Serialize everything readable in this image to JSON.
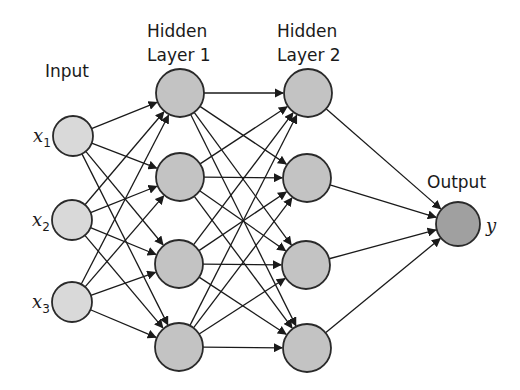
{
  "diagram": {
    "colors": {
      "input_fill": "#d9d9d9",
      "hidden_fill": "#c3c3c3",
      "output_fill": "#a0a0a0",
      "stroke": "#2a2a2a",
      "edge": "#1a1a1a"
    },
    "layers": [
      {
        "id": "input",
        "label_lines": [
          "Input"
        ],
        "label_pos": [
          45,
          77
        ],
        "radius": 20,
        "fill_key": "input_fill",
        "nodes": [
          {
            "cx": 73,
            "cy": 136,
            "var": "x",
            "sub": "1"
          },
          {
            "cx": 72,
            "cy": 220,
            "var": "x",
            "sub": "2"
          },
          {
            "cx": 72,
            "cy": 302,
            "var": "x",
            "sub": "3"
          }
        ]
      },
      {
        "id": "hidden1",
        "label_lines": [
          "Hidden",
          "Layer 1"
        ],
        "label_pos": [
          147,
          37
        ],
        "radius": 24,
        "fill_key": "hidden_fill",
        "nodes": [
          {
            "cx": 180,
            "cy": 93
          },
          {
            "cx": 180,
            "cy": 177
          },
          {
            "cx": 179,
            "cy": 264
          },
          {
            "cx": 179,
            "cy": 347
          }
        ]
      },
      {
        "id": "hidden2",
        "label_lines": [
          "Hidden",
          "Layer 2"
        ],
        "label_pos": [
          277,
          37
        ],
        "radius": 24,
        "fill_key": "hidden_fill",
        "nodes": [
          {
            "cx": 308,
            "cy": 93
          },
          {
            "cx": 307,
            "cy": 178
          },
          {
            "cx": 306,
            "cy": 265
          },
          {
            "cx": 307,
            "cy": 348
          }
        ]
      },
      {
        "id": "output",
        "label_lines": [
          "Output"
        ],
        "label_pos": [
          427,
          188
        ],
        "radius": 22,
        "fill_key": "output_fill",
        "nodes": [
          {
            "cx": 458,
            "cy": 224,
            "var": "y",
            "var_pos": [
              486,
              232
            ]
          }
        ]
      }
    ],
    "connections": "fully-connected between consecutive layers, arrows pointing forward"
  }
}
